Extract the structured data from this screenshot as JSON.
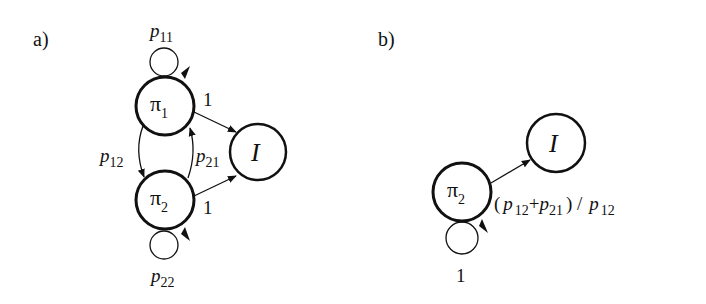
{
  "panels": [
    {
      "id": "a",
      "label": "a)",
      "nodes": [
        {
          "id": "pi1",
          "symbol": "π",
          "sub": "1"
        },
        {
          "id": "pi2",
          "symbol": "π",
          "sub": "2"
        },
        {
          "id": "I",
          "symbol": "I"
        }
      ],
      "edges": [
        {
          "from": "pi1",
          "to": "pi1",
          "label": "p",
          "sub": "11"
        },
        {
          "from": "pi1",
          "to": "pi2",
          "label": "p",
          "sub": "12"
        },
        {
          "from": "pi2",
          "to": "pi1",
          "label": "p",
          "sub": "21"
        },
        {
          "from": "pi2",
          "to": "pi2",
          "label": "p",
          "sub": "22"
        },
        {
          "from": "pi1",
          "to": "I",
          "label": "1"
        },
        {
          "from": "pi2",
          "to": "I",
          "label": "1"
        }
      ]
    },
    {
      "id": "b",
      "label": "b)",
      "nodes": [
        {
          "id": "pi2",
          "symbol": "π",
          "sub": "2"
        },
        {
          "id": "I",
          "symbol": "I"
        }
      ],
      "edges": [
        {
          "from": "pi2",
          "to": "I",
          "label_parts": [
            "(",
            "p",
            "12",
            "+",
            "p",
            "21",
            ") / ",
            "p",
            "12"
          ]
        },
        {
          "from": "pi2",
          "to": "pi2",
          "label": "1"
        }
      ]
    }
  ]
}
